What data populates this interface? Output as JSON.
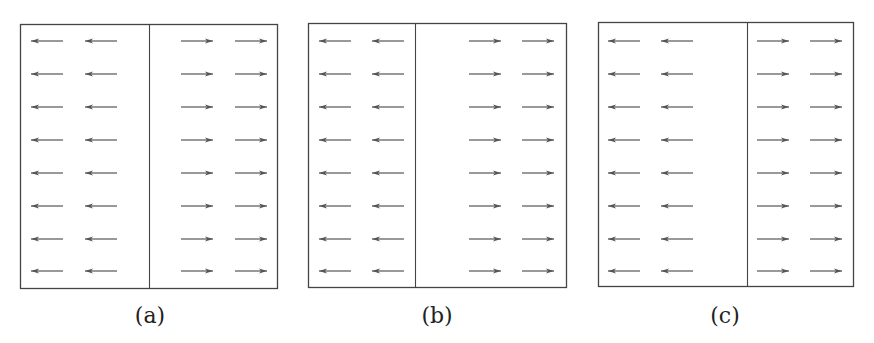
{
  "figure": {
    "colors": {
      "frame": "#444444",
      "arrow": "#555555",
      "background": "#ffffff"
    },
    "rows_y": [
      41,
      74,
      107,
      140,
      173,
      206,
      239,
      271
    ],
    "arrow_length": 32,
    "panels": [
      {
        "id": "a",
        "label": "(a)",
        "label_x": 150,
        "label_y": 303,
        "box": {
          "x": 20,
          "y": 24,
          "w": 257,
          "h": 264
        },
        "divider_x": 149,
        "left_arrows_x": [
          31,
          85
        ],
        "right_arrows_x": [
          181,
          235
        ],
        "left_direction": "left",
        "right_direction": "right"
      },
      {
        "id": "b",
        "label": "(b)",
        "label_x": 437,
        "label_y": 303,
        "box": {
          "x": 308,
          "y": 23,
          "w": 258,
          "h": 264
        },
        "divider_x": 415,
        "left_arrows_x": [
          319,
          372
        ],
        "right_arrows_x": [
          469,
          522
        ],
        "left_direction": "left",
        "right_direction": "right"
      },
      {
        "id": "c",
        "label": "(c)",
        "label_x": 725,
        "label_y": 303,
        "box": {
          "x": 598,
          "y": 22,
          "w": 255,
          "h": 264
        },
        "divider_x": 747,
        "left_arrows_x": [
          608,
          661
        ],
        "right_arrows_x": [
          757,
          810
        ],
        "left_direction": "left",
        "right_direction": "right"
      }
    ]
  }
}
